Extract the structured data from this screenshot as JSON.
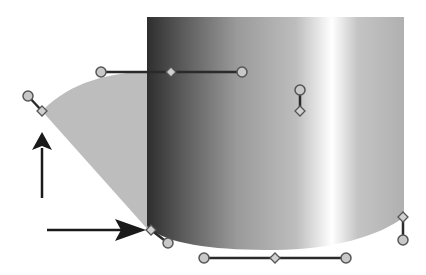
{
  "diagram": {
    "type": "bezier-path-editing",
    "colors": {
      "background": "#ffffff",
      "wedge_fill": "#bdbdbd",
      "handle_line": "#2a2a2a",
      "anchor_fill": "#c8c8c8",
      "anchor_stroke": "#555555",
      "arrow": "#1a1a1a",
      "gradient_stops": [
        "#2e2e2e",
        "#555555",
        "#9a9a9a",
        "#b8b8b8",
        "#ffffff",
        "#c4c4c4",
        "#b0b0b0"
      ]
    },
    "shape": {
      "left": 147,
      "top": 17,
      "right": 404,
      "bottom_left": [
        151,
        230
      ],
      "bottom_right": [
        404,
        217
      ]
    },
    "handles": [
      {
        "name": "top-handle",
        "a": [
          101,
          72
        ],
        "mid": [
          171,
          72
        ],
        "b": [
          242,
          72
        ]
      },
      {
        "name": "left-handle",
        "a": [
          28,
          96
        ],
        "b": [
          42,
          111
        ]
      },
      {
        "name": "inner-handle",
        "a": [
          300,
          90
        ],
        "b": [
          300,
          111
        ]
      },
      {
        "name": "bottom-left-handle",
        "a": [
          151,
          230
        ],
        "b": [
          168,
          243
        ]
      },
      {
        "name": "bottom-handle",
        "a": [
          204,
          258
        ],
        "mid": [
          275,
          258
        ],
        "b": [
          346,
          258
        ]
      },
      {
        "name": "right-handle",
        "a": [
          403,
          217
        ],
        "b": [
          403,
          240
        ]
      }
    ],
    "arrows": [
      {
        "name": "vertical-arrow",
        "direction": "up"
      },
      {
        "name": "horizontal-arrow",
        "direction": "right"
      }
    ]
  }
}
